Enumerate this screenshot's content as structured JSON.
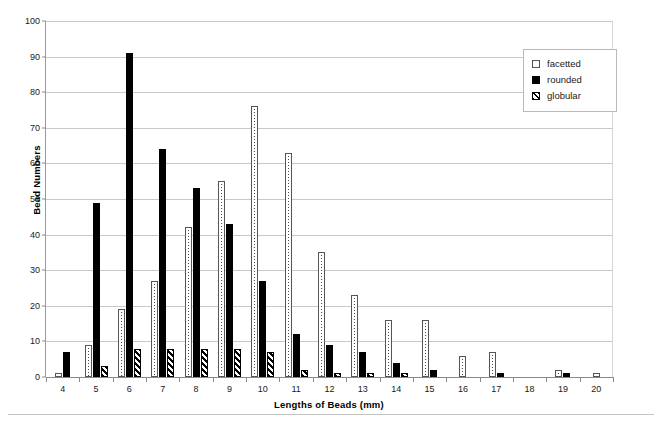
{
  "chart_data": {
    "type": "bar",
    "title": "",
    "xlabel": "Lengths of Beads (mm)",
    "ylabel": "Bead Numbers",
    "categories": [
      "4",
      "5",
      "6",
      "7",
      "8",
      "9",
      "10",
      "11",
      "12",
      "13",
      "14",
      "15",
      "16",
      "17",
      "18",
      "19",
      "20"
    ],
    "ylim": [
      0,
      100
    ],
    "yticks": [
      "0",
      "10",
      "20",
      "30",
      "40",
      "50",
      "60",
      "70",
      "80",
      "90",
      "100"
    ],
    "grid": true,
    "legend_position": "top-right",
    "series": [
      {
        "name": "facetted",
        "pattern": "dotted",
        "values": [
          1,
          9,
          19,
          27,
          42,
          55,
          76,
          63,
          35,
          23,
          16,
          16,
          6,
          7,
          0,
          2,
          1
        ]
      },
      {
        "name": "rounded",
        "pattern": "solid-black",
        "values": [
          7,
          49,
          91,
          64,
          53,
          43,
          27,
          12,
          9,
          7,
          4,
          2,
          0,
          1,
          0,
          1,
          0
        ]
      },
      {
        "name": "globular",
        "pattern": "diagonal-hatch",
        "values": [
          0,
          3,
          8,
          8,
          8,
          8,
          7,
          2,
          1,
          1,
          1,
          0,
          0,
          0,
          0,
          0,
          0
        ]
      }
    ]
  },
  "legend": {
    "items": [
      {
        "label": "facetted"
      },
      {
        "label": "rounded"
      },
      {
        "label": "globular"
      }
    ]
  },
  "axes": {
    "y_title": "Bead Numbers",
    "x_title": "Lengths of Beads (mm)"
  }
}
